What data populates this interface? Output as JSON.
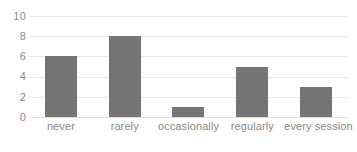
{
  "chart_data": {
    "type": "bar",
    "title": "",
    "xlabel": "",
    "ylabel": "",
    "categories": [
      "never",
      "rarely",
      "occasionally",
      "regularly",
      "every session"
    ],
    "values": [
      6,
      8,
      1,
      5,
      3
    ],
    "ylim": [
      0,
      10
    ],
    "y_ticks": [
      0,
      2,
      4,
      6,
      8,
      10
    ],
    "y_tick_labels": [
      "0",
      "2",
      "4",
      "6",
      "8",
      "10"
    ],
    "grid": true,
    "grid_axis": "y",
    "legend": false,
    "legend_position": "none",
    "series": [
      {
        "name": "responses",
        "values": [
          6,
          8,
          1,
          5,
          3
        ]
      }
    ]
  },
  "style": {
    "bar_color": "#757575",
    "gridline_color": "#e9e9e9",
    "baseline_color": "#dcdcdc",
    "tick_label_color": "#8a8a8a",
    "background_color": "#ffffff"
  }
}
